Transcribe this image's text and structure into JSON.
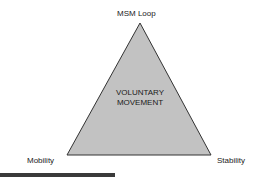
{
  "diagram": {
    "apex_label": "MSM Loop",
    "left_label": "Mobility",
    "right_label": "Stability",
    "center_line1": "VOLUNTARY",
    "center_line2": "MOVEMENT",
    "colors": {
      "fill": "#c2c2c2",
      "stroke": "#333333",
      "bar": "#3a3a3a"
    }
  }
}
